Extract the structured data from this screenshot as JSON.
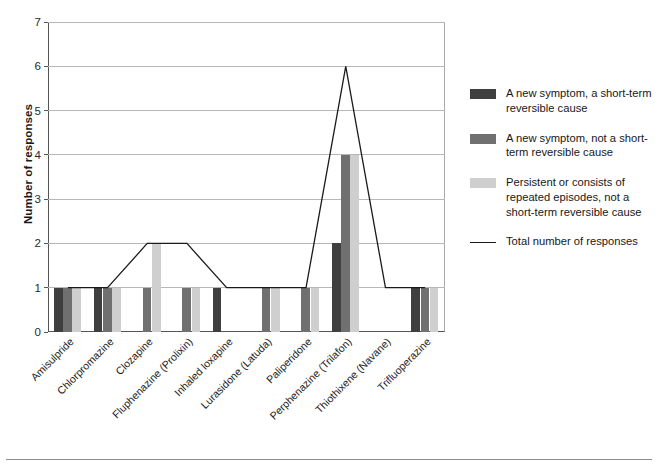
{
  "chart_data": {
    "type": "bar",
    "title": "",
    "xlabel": "",
    "ylabel": "Number of responses",
    "ylim": [
      0,
      7
    ],
    "yticks": [
      0,
      1,
      2,
      3,
      4,
      5,
      6,
      7
    ],
    "grid": true,
    "legend_position": "right",
    "categories": [
      "Amisulpride",
      "Chlorpromazine",
      "Clozapine",
      "Fluphenazine (Prolixin)",
      "Inhaled loxapine",
      "Lurasidone (Latuda)",
      "Paliperidone",
      "Perphenazine (Trilafon)",
      "Thiothixene (Navane)",
      "Trifluoperazine"
    ],
    "series": [
      {
        "name": "A new symptom, a short-term reversible cause",
        "color": "#3f3f3f",
        "values": [
          1,
          1,
          0,
          0,
          1,
          0,
          0,
          2,
          0,
          1
        ]
      },
      {
        "name": "A new symptom, not a short-term reversible cause",
        "color": "#707070",
        "values": [
          1,
          1,
          1,
          1,
          0,
          1,
          1,
          4,
          0,
          1
        ]
      },
      {
        "name": "Persistent or consists of repeated episodes, not a short-term reversible cause",
        "color": "#cfcfcf",
        "values": [
          1,
          1,
          2,
          1,
          0,
          1,
          1,
          4,
          0,
          1
        ]
      }
    ],
    "line_series": {
      "name": "Total number of responses",
      "color": "#1a1a1a",
      "values": [
        1,
        1,
        2,
        2,
        1,
        1,
        1,
        6,
        1,
        1
      ]
    }
  },
  "legend": {
    "entries": [
      {
        "swatch": "dark-gray-swatch",
        "label": "A new symptom, a short-term reversible cause",
        "color": "#3f3f3f",
        "kind": "bar"
      },
      {
        "swatch": "medium-gray-swatch",
        "label": "A new symptom, not a short-term reversible cause",
        "color": "#707070",
        "kind": "bar"
      },
      {
        "swatch": "light-gray-swatch",
        "label": "Persistent or consists of repeated episodes, not a short-term reversible cause",
        "color": "#cfcfcf",
        "kind": "bar"
      },
      {
        "swatch": "line-swatch",
        "label": "Total number of responses",
        "color": "#1a1a1a",
        "kind": "line"
      }
    ]
  }
}
